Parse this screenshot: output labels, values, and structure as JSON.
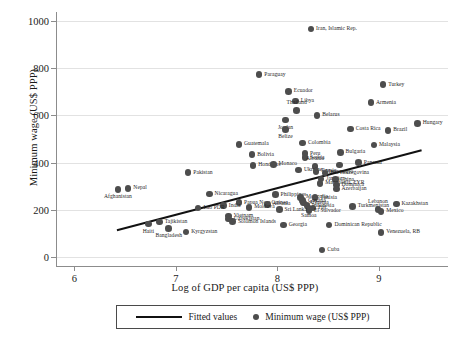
{
  "chart_data": {
    "type": "scatter",
    "title": "",
    "xlabel": "Log of GDP per capita (US$ PPP)",
    "ylabel": "Minimum wage (US$ PPP)",
    "xlim": [
      5.82,
      9.68
    ],
    "ylim": [
      -40,
      1040
    ],
    "xticks": [
      6,
      7,
      8,
      9
    ],
    "yticks": [
      0,
      200,
      400,
      600,
      800,
      1000
    ],
    "grid": "horizontal",
    "legend_position": "below-axes",
    "legend": [
      {
        "label": "Fitted values",
        "marker": "line"
      },
      {
        "label": "Minimum wage (US$ PPP)",
        "marker": "circle"
      }
    ],
    "fit_line": {
      "x": [
        6.42,
        9.42
      ],
      "y": [
        112,
        452
      ]
    },
    "points": [
      {
        "name": "Iran, Islamic Rep.",
        "x": 8.33,
        "y": 967,
        "pos": "right"
      },
      {
        "name": "Paraguay",
        "x": 7.82,
        "y": 773,
        "pos": "right"
      },
      {
        "name": "Turkey",
        "x": 9.04,
        "y": 731,
        "pos": "right"
      },
      {
        "name": "Ecuador",
        "x": 8.11,
        "y": 702,
        "pos": "right"
      },
      {
        "name": "Libya",
        "x": 8.18,
        "y": 662,
        "pos": "right"
      },
      {
        "name": "Armenia",
        "x": 8.92,
        "y": 655,
        "pos": "right"
      },
      {
        "name": "Thailand",
        "x": 8.19,
        "y": 620,
        "pos": "above"
      },
      {
        "name": "Belarus",
        "x": 8.39,
        "y": 600,
        "pos": "right"
      },
      {
        "name": "Jordan",
        "x": 8.08,
        "y": 580,
        "pos": "below"
      },
      {
        "name": "Hungary",
        "x": 9.38,
        "y": 566,
        "pos": "right"
      },
      {
        "name": "Belize",
        "x": 8.08,
        "y": 541,
        "pos": "below"
      },
      {
        "name": "Costa Rica",
        "x": 8.72,
        "y": 542,
        "pos": "right"
      },
      {
        "name": "Brazil",
        "x": 9.09,
        "y": 537,
        "pos": "right"
      },
      {
        "name": "Guatemala",
        "x": 7.62,
        "y": 477,
        "pos": "right"
      },
      {
        "name": "Colombia",
        "x": 8.25,
        "y": 483,
        "pos": "right"
      },
      {
        "name": "Malaysia",
        "x": 8.95,
        "y": 474,
        "pos": "right"
      },
      {
        "name": "Peru",
        "x": 8.27,
        "y": 438,
        "pos": "right"
      },
      {
        "name": "Bulgaria",
        "x": 8.62,
        "y": 443,
        "pos": "right"
      },
      {
        "name": "Serbia",
        "x": 8.27,
        "y": 421,
        "pos": "right"
      },
      {
        "name": "Bolivia",
        "x": 7.75,
        "y": 434,
        "pos": "right"
      },
      {
        "name": "Pakistan",
        "x": 7.12,
        "y": 357,
        "pos": "right"
      },
      {
        "name": "Honduras",
        "x": 7.76,
        "y": 388,
        "pos": "right"
      },
      {
        "name": "Monaco",
        "x": 7.96,
        "y": 392,
        "pos": "right"
      },
      {
        "name": "Panama",
        "x": 8.8,
        "y": 400,
        "pos": "right"
      },
      {
        "name": "Montenegro",
        "x": 8.61,
        "y": 390,
        "pos": "below"
      },
      {
        "name": "Albania",
        "x": 8.37,
        "y": 383,
        "pos": "above"
      },
      {
        "name": "Ukraine",
        "x": 8.21,
        "y": 368,
        "pos": "right"
      },
      {
        "name": "Russia",
        "x": 8.38,
        "y": 362,
        "pos": "right"
      },
      {
        "name": "Bol Herzegovina",
        "x": 8.47,
        "y": 356,
        "pos": "right"
      },
      {
        "name": "Jamaica",
        "x": 8.43,
        "y": 330,
        "pos": "right"
      },
      {
        "name": "China",
        "x": 8.57,
        "y": 327,
        "pos": "right"
      },
      {
        "name": "Macedonia, FYR",
        "x": 8.42,
        "y": 312,
        "pos": "right"
      },
      {
        "name": "Dominica",
        "x": 8.58,
        "y": 305,
        "pos": "right"
      },
      {
        "name": "Azerbaijan",
        "x": 8.58,
        "y": 288,
        "pos": "right"
      },
      {
        "name": "Nepal",
        "x": 6.53,
        "y": 290,
        "pos": "right"
      },
      {
        "name": "Afghanistan",
        "x": 6.43,
        "y": 286,
        "pos": "below"
      },
      {
        "name": "Nicaragua",
        "x": 7.33,
        "y": 267,
        "pos": "right"
      },
      {
        "name": "Philippines",
        "x": 7.98,
        "y": 263,
        "pos": "right"
      },
      {
        "name": "Mongolia",
        "x": 8.23,
        "y": 252,
        "pos": "right"
      },
      {
        "name": "Tunisia",
        "x": 8.37,
        "y": 251,
        "pos": "right"
      },
      {
        "name": "Guyana",
        "x": 8.25,
        "y": 238,
        "pos": "right"
      },
      {
        "name": "Armenia",
        "x": 8.26,
        "y": 228,
        "pos": "right"
      },
      {
        "name": "Indonesia",
        "x": 8.29,
        "y": 217,
        "pos": "right"
      },
      {
        "name": "Fiji",
        "x": 8.35,
        "y": 207,
        "pos": "right"
      },
      {
        "name": "Samoa",
        "x": 8.31,
        "y": 205,
        "pos": "below"
      },
      {
        "name": "El Salvador",
        "x": 8.31,
        "y": 194,
        "pos": "right"
      },
      {
        "name": "Turkmenistan",
        "x": 8.74,
        "y": 213,
        "pos": "right"
      },
      {
        "name": "Kazakhstan",
        "x": 9.17,
        "y": 223,
        "pos": "right"
      },
      {
        "name": "Lebanon",
        "x": 8.99,
        "y": 199,
        "pos": "above"
      },
      {
        "name": "Mexico",
        "x": 9.02,
        "y": 192,
        "pos": "right"
      },
      {
        "name": "Papua New Guinea",
        "x": 7.62,
        "y": 230,
        "pos": "right"
      },
      {
        "name": "Albania",
        "x": 7.9,
        "y": 222,
        "pos": "right"
      },
      {
        "name": "India",
        "x": 7.47,
        "y": 217,
        "pos": "right"
      },
      {
        "name": "Moldova",
        "x": 7.72,
        "y": 209,
        "pos": "right"
      },
      {
        "name": "Lao PDR",
        "x": 7.22,
        "y": 206,
        "pos": "right"
      },
      {
        "name": "Sri Lanka",
        "x": 8.02,
        "y": 200,
        "pos": "right"
      },
      {
        "name": "Tajikistan",
        "x": 6.84,
        "y": 147,
        "pos": "right"
      },
      {
        "name": "Haiti",
        "x": 6.73,
        "y": 138,
        "pos": "below"
      },
      {
        "name": "Vietnam",
        "x": 7.52,
        "y": 172,
        "pos": "right"
      },
      {
        "name": "Uzbekistan",
        "x": 7.52,
        "y": 159,
        "pos": "right"
      },
      {
        "name": "Solomon Islands",
        "x": 7.56,
        "y": 148,
        "pos": "right"
      },
      {
        "name": "Georgia",
        "x": 8.06,
        "y": 134,
        "pos": "right"
      },
      {
        "name": "Dominican Republic",
        "x": 8.51,
        "y": 134,
        "pos": "right"
      },
      {
        "name": "Bangladesh",
        "x": 6.93,
        "y": 120,
        "pos": "below"
      },
      {
        "name": "Kyrgyzstan",
        "x": 7.1,
        "y": 104,
        "pos": "right"
      },
      {
        "name": "Venezuela, RB",
        "x": 9.02,
        "y": 103,
        "pos": "right"
      },
      {
        "name": "Cuba",
        "x": 8.44,
        "y": 28,
        "pos": "right"
      }
    ]
  }
}
